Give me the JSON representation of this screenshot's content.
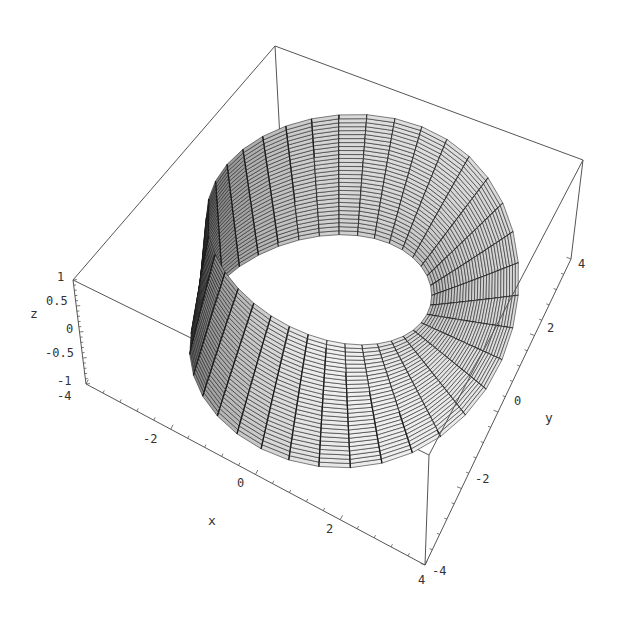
{
  "chart_data": {
    "type": "surface3d",
    "title": "",
    "xlabel": "x",
    "ylabel": "y",
    "zlabel": "z",
    "xlim": [
      -4,
      4
    ],
    "ylim": [
      -4,
      4
    ],
    "zlim": [
      -1,
      1
    ],
    "x_ticks": [
      "-4",
      "-2",
      "0",
      "2",
      "4"
    ],
    "y_ticks": [
      "-4",
      "-2",
      "0",
      "2",
      "4"
    ],
    "z_ticks": [
      "-1",
      "-0.5",
      "0",
      "0.5",
      "1"
    ],
    "surface": {
      "center_radius": 3,
      "half_width": 1,
      "height": 1,
      "theta_divisions": 36,
      "s_divisions": 30
    },
    "grid": false,
    "boxed": true
  },
  "labels": {
    "x_axis": "x",
    "y_axis": "y",
    "z_axis": "z",
    "x_tick_labels": [
      {
        "text": "-2",
        "x": 143,
        "y": 443
      },
      {
        "text": "0",
        "x": 237,
        "y": 487
      },
      {
        "text": "2",
        "x": 326,
        "y": 533
      },
      {
        "text": "4",
        "x": 418,
        "y": 584
      }
    ],
    "y_tick_labels": [
      {
        "text": "-4",
        "x": 432,
        "y": 575
      },
      {
        "text": "-2",
        "x": 475,
        "y": 483
      },
      {
        "text": "0",
        "x": 514,
        "y": 405
      },
      {
        "text": "2",
        "x": 547,
        "y": 332
      },
      {
        "text": "4",
        "x": 578,
        "y": 268
      }
    ],
    "z_tick_labels": [
      {
        "text": "1",
        "x": 57,
        "y": 281
      },
      {
        "text": "0.5",
        "x": 46,
        "y": 305
      },
      {
        "text": "0",
        "x": 66,
        "y": 333
      },
      {
        "text": "-0.5",
        "x": 45,
        "y": 357
      },
      {
        "text": "-1",
        "x": 57,
        "y": 385
      },
      {
        "text": "-4",
        "x": 57,
        "y": 400
      }
    ],
    "x_axis_pos": {
      "x": 208,
      "y": 525
    },
    "y_axis_pos": {
      "x": 545,
      "y": 422
    },
    "z_axis_pos": {
      "x": 30,
      "y": 318
    }
  },
  "box": {
    "top": {
      "mm": [
        73,
        280
      ],
      "pm": [
        429,
        455
      ],
      "pp": [
        583,
        160
      ],
      "mp": [
        275,
        46
      ]
    },
    "bottom": {
      "mm": [
        86,
        384
      ],
      "pm": [
        425,
        565
      ],
      "pp": [
        571,
        259
      ],
      "mp": [
        280,
        139
      ]
    }
  },
  "colors": {
    "line": "#555555",
    "mesh": "#1a1a1a",
    "fill_light": "#e8e8e8",
    "fill_dark": "#3a3a3a",
    "text": "#333333"
  }
}
